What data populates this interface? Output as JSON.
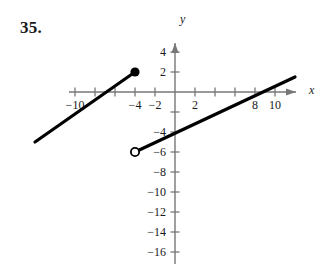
{
  "problem": {
    "number": "35."
  },
  "axes": {
    "x_label": "x",
    "y_label": "y",
    "x_ticks_labeled": [
      {
        "value": -10,
        "label": "-10"
      },
      {
        "value": -4,
        "label": "-4"
      },
      {
        "value": -2,
        "label": "-2"
      },
      {
        "value": 2,
        "label": "2"
      },
      {
        "value": 8,
        "label": "8"
      },
      {
        "value": 10,
        "label": "10"
      }
    ],
    "x_ticks_all": [
      -10,
      -8,
      -6,
      -4,
      -2,
      2,
      4,
      6,
      8,
      10
    ],
    "y_ticks_labeled": [
      {
        "value": 4,
        "label": "4"
      },
      {
        "value": 2,
        "label": "2"
      },
      {
        "value": -4,
        "label": "-4"
      },
      {
        "value": -6,
        "label": "-6"
      },
      {
        "value": -8,
        "label": "-8"
      },
      {
        "value": -10,
        "label": "-10"
      },
      {
        "value": -12,
        "label": "-12"
      },
      {
        "value": -14,
        "label": "-14"
      },
      {
        "value": -16,
        "label": "-16"
      }
    ],
    "y_ticks_all": [
      4,
      2,
      -2,
      -4,
      -6,
      -8,
      -10,
      -12,
      -14,
      -16
    ],
    "axis_color": "#777777",
    "curve_color": "#000000"
  },
  "chart_data": {
    "type": "line",
    "title": "",
    "xlabel": "x",
    "ylabel": "y",
    "xlim": [
      -15,
      13
    ],
    "ylim": [
      -17.5,
      5.5
    ],
    "grid": false,
    "legend": "none",
    "series": [
      {
        "name": "left-branch",
        "points": [
          [
            -14,
            -5
          ],
          [
            -4,
            2
          ]
        ],
        "endpoint_left": "none",
        "endpoint_right": "closed-dot"
      },
      {
        "name": "right-branch",
        "points": [
          [
            -4,
            -6
          ],
          [
            12,
            1.5
          ]
        ],
        "endpoint_left": "open-circle",
        "endpoint_right": "none"
      }
    ],
    "annotations": [
      {
        "kind": "closed-dot",
        "x": -4,
        "y": 2
      },
      {
        "kind": "open-circle",
        "x": -4,
        "y": -6
      }
    ]
  }
}
